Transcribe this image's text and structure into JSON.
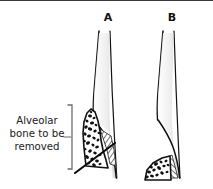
{
  "figure": {
    "type": "line-drawing-illustration",
    "background_color": "#ffffff",
    "ink_color": "#111111",
    "border": {
      "position": "top",
      "color": "#3a3a3a",
      "thickness_px": 1
    }
  },
  "panels": [
    {
      "id": "A",
      "label": "A",
      "label_x": 108,
      "label_y": 21,
      "description": "tooth root with full alveolar bone crest present and osteotomy cut line marked"
    },
    {
      "id": "B",
      "label": "B",
      "label_x": 172,
      "label_y": 21,
      "description": "same tooth root after alveolar bone has been removed leaving a low flat ridge"
    }
  ],
  "callout": {
    "lines": [
      "Alveolar",
      "bone to be",
      "removed"
    ],
    "full_text": "Alveolar bone to be removed",
    "text_center_x": 37,
    "line_y": [
      124,
      137,
      150
    ],
    "leader_dash": {
      "x1": 64,
      "y1": 137,
      "x2": 71,
      "y2": 137
    },
    "bracket": {
      "x": 72,
      "y_top": 105,
      "y_bottom": 169,
      "hook_length": 4,
      "color": "#6d6d6d"
    }
  },
  "colors": {
    "ink": "#111111",
    "bone_fill": "#ffffff",
    "trabecula": "#101010",
    "hatch": "#2a2a2a",
    "bracket": "#6d6d6d",
    "root_shade": "#d8d8d8",
    "border": "#3a3a3a"
  }
}
